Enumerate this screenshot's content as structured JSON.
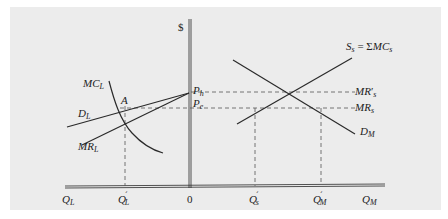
{
  "diagram": {
    "type": "economics-market-supply-demand",
    "background": "#ececec",
    "line_color": "#2a2a2a",
    "axis": {
      "vertical_label": "$",
      "origin_label": "0",
      "left_quantity_label": "Q",
      "left_quantity_sub": "L",
      "right_quantity_label": "Q",
      "right_quantity_sub": "M"
    },
    "prices": {
      "high": {
        "main": "P",
        "sub": "h"
      },
      "equilibrium": {
        "main": "P",
        "sub": "e"
      }
    },
    "left_market": {
      "mc": {
        "main": "MC",
        "sub": "L"
      },
      "demand": {
        "main": "D",
        "sub": "L"
      },
      "mr": {
        "main": "MR",
        "sub": "L"
      },
      "point": "A",
      "quantity_tick": {
        "main": "Q",
        "sub": "L",
        "prime": "´"
      }
    },
    "right_market": {
      "supply": {
        "main": "S",
        "sub": "s",
        "eq": " = ",
        "sum": "Σ",
        "mc": "MC",
        "mc_sub": "s"
      },
      "demand": {
        "main": "D",
        "sub": "M"
      },
      "mr_prime": {
        "main": "MR",
        "prime": "′",
        "sub": "s"
      },
      "mr": {
        "main": "MR",
        "sub": "s"
      },
      "quantity_tick_s": {
        "main": "Q",
        "sub": "s",
        "prime": "´"
      },
      "quantity_tick_m": {
        "main": "Q",
        "sub": "M",
        "prime": "´"
      }
    }
  }
}
